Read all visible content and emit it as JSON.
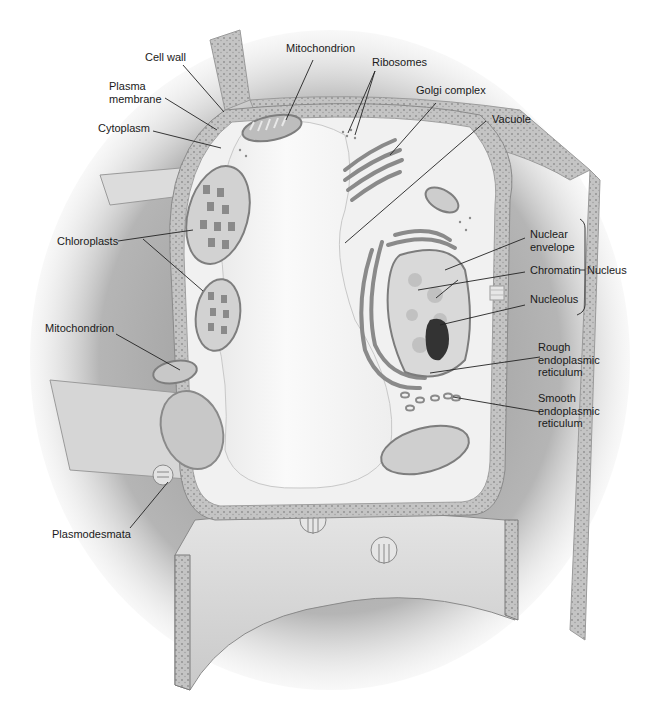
{
  "diagram": {
    "colors": {
      "background": "#ffffff",
      "shadow": "#8a8a8a",
      "cell_wall": "#c8c8c8",
      "cytoplasm": "#f2f2f2",
      "vacuole": "#f7f7f7",
      "organelle": "#9a9a9a",
      "nucleolus": "#2e2e2e",
      "leader_line": "#222222",
      "label_text": "#1a1a1a"
    },
    "labels": {
      "cell_wall": "Cell wall",
      "plasma_membrane": "Plasma\nmembrane",
      "cytoplasm": "Cytoplasm",
      "mitochondrion_top": "Mitochondrion",
      "ribosomes": "Ribosomes",
      "golgi_complex": "Golgi complex",
      "vacuole": "Vacuole",
      "chloroplasts": "Chloroplasts",
      "mitochondrion_left": "Mitochondrion",
      "nuclear_envelope": "Nuclear\nenvelope",
      "chromatin": "Chromatin",
      "nucleolus": "Nucleolus",
      "nucleus": "Nucleus",
      "rough_er": "Rough\nendoplasmic\nreticulum",
      "smooth_er": "Smooth\nendoplasmic\nreticulum",
      "plasmodesmata": "Plasmodesmata"
    },
    "groups": [
      {
        "name": "Nucleus",
        "members": [
          "Nuclear envelope",
          "Chromatin",
          "Nucleolus"
        ]
      }
    ]
  }
}
